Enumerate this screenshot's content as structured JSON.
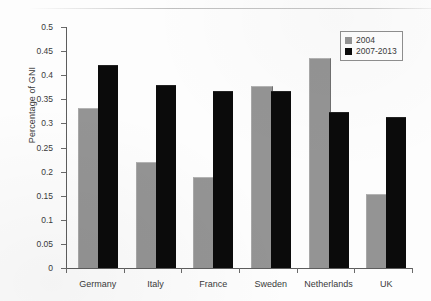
{
  "chart_data": {
    "type": "bar",
    "title": "",
    "xlabel": "",
    "ylabel": "Percentage of GNI",
    "ylim": [
      0,
      0.5
    ],
    "ytick_step": 0.05,
    "grid": false,
    "legend_position": "top-right",
    "categories": [
      "Germany",
      "Italy",
      "France",
      "Sweden",
      "Netherlands",
      "UK"
    ],
    "ytick_labels": [
      "0",
      "0.05",
      "0.1",
      "0.15",
      "0.2",
      "0.25",
      "0.3",
      "0.35",
      "0.4",
      "0.45",
      "0.5"
    ],
    "ytick_values": [
      0,
      0.05,
      0.1,
      0.15,
      0.2,
      0.25,
      0.3,
      0.35,
      0.4,
      0.45,
      0.5
    ],
    "series": [
      {
        "name": "2004",
        "color": "#949494",
        "values": [
          0.329,
          0.217,
          0.186,
          0.375,
          0.434,
          0.151
        ]
      },
      {
        "name": "2007-2013",
        "color": "#0b0b0b",
        "values": [
          0.419,
          0.378,
          0.366,
          0.365,
          0.322,
          0.311
        ]
      }
    ]
  },
  "legend": {
    "items": [
      {
        "label": "2004",
        "series": 0
      },
      {
        "label": "2007-2013",
        "series": 1
      }
    ]
  },
  "colors": {
    "series_2004": "#949494",
    "series_2007_2013": "#0b0b0b",
    "axis": "#5d5d5d",
    "background": "#fdfdfd"
  }
}
